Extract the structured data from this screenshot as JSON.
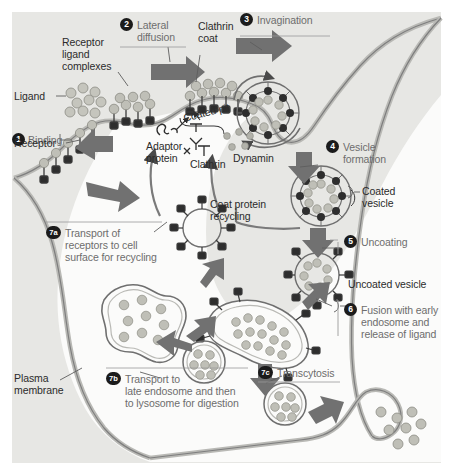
{
  "figure": {
    "background_color": "#e9e9e7",
    "interior_color": "#fbfbfa",
    "membrane_color": "#7d7d7d",
    "arrow_color": "#6e6e6e",
    "badge_color": "#1b1b1b",
    "ligand_color": "#bdbdb5",
    "clathrin_color": "#3a3a3a"
  },
  "steps": [
    {
      "num": "1",
      "label": "Binding"
    },
    {
      "num": "2",
      "label": "Lateral\ndiffusion"
    },
    {
      "num": "3",
      "label": "Invagination"
    },
    {
      "num": "4",
      "label": "Vesicle\nformation"
    },
    {
      "num": "5",
      "label": "Uncoating"
    },
    {
      "num": "6",
      "label": "Fusion with early\nendosome and\nrelease of ligand"
    },
    {
      "num": "7a",
      "label": "Transport of\nreceptors to cell\nsurface for recycling"
    },
    {
      "num": "7b",
      "label": "Transport to\nlate endosome and then\nto lysosome for digestion"
    },
    {
      "num": "7c",
      "label": "Transcytosis"
    }
  ],
  "labels": {
    "ligand": "Ligand",
    "receptor": "Receptor",
    "receptor_ligand_complexes": "Receptor\nligand\ncomplexes",
    "clathrin_coat": "Clathrin\ncoat",
    "coated_pit": "Coated pit",
    "adaptor_protein": "Adaptor\nprotein",
    "clathrin": "Clathrin",
    "dynamin": "Dynamin",
    "coat_protein_recycling": "Coat protein\nrecycling",
    "coated_vesicle": "Coated\nvesicle",
    "uncoated_vesicle": "Uncoated vesicle",
    "plasma_membrane": "Plasma\nmembrane"
  }
}
